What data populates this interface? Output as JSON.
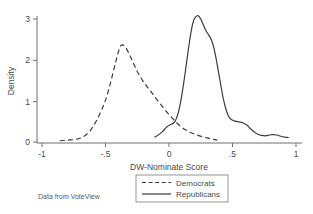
{
  "chart_data": {
    "type": "line",
    "title": "",
    "subtitle": "",
    "xlabel": "DW-Nominate Score",
    "ylabel": "Density",
    "xlim": [
      -1,
      1
    ],
    "ylim": [
      0,
      3.3
    ],
    "xticks": [
      -1,
      -0.5,
      0,
      0.5,
      1
    ],
    "xticklabels": [
      "-1",
      "-.5",
      "0",
      ".5",
      "1"
    ],
    "yticks": [
      0,
      1,
      2,
      3
    ],
    "yticklabels": [
      "0",
      "1",
      "2",
      "3"
    ],
    "grid": false,
    "legend_position": "below-axis-center",
    "annotation": "Data from VoteView",
    "series": [
      {
        "name": "Democrats",
        "style": "dashed",
        "color": "#3c3c3c",
        "peak_x": -0.37,
        "peak_y": 2.37,
        "x": [
          -0.86,
          -0.82,
          -0.78,
          -0.74,
          -0.7,
          -0.66,
          -0.62,
          -0.58,
          -0.54,
          -0.5,
          -0.46,
          -0.42,
          -0.39,
          -0.37,
          -0.34,
          -0.31,
          -0.28,
          -0.25,
          -0.22,
          -0.19,
          -0.16,
          -0.13,
          -0.1,
          -0.06,
          -0.02,
          0.02,
          0.06,
          0.1,
          0.14,
          0.18,
          0.22,
          0.26,
          0.3,
          0.34,
          0.38
        ],
        "y": [
          0.03,
          0.04,
          0.05,
          0.06,
          0.09,
          0.16,
          0.28,
          0.47,
          0.72,
          1.02,
          1.45,
          1.95,
          2.28,
          2.37,
          2.3,
          2.12,
          1.92,
          1.72,
          1.56,
          1.42,
          1.3,
          1.18,
          1.05,
          0.9,
          0.74,
          0.6,
          0.47,
          0.36,
          0.28,
          0.22,
          0.17,
          0.13,
          0.1,
          0.07,
          0.05
        ]
      },
      {
        "name": "Republicans",
        "style": "solid",
        "color": "#3c3c3c",
        "peak_x": 0.23,
        "peak_y": 3.08,
        "x": [
          -0.11,
          -0.08,
          -0.05,
          -0.02,
          0.01,
          0.03,
          0.05,
          0.07,
          0.09,
          0.11,
          0.13,
          0.15,
          0.17,
          0.19,
          0.21,
          0.23,
          0.25,
          0.27,
          0.29,
          0.31,
          0.33,
          0.35,
          0.37,
          0.39,
          0.41,
          0.43,
          0.45,
          0.47,
          0.49,
          0.52,
          0.55,
          0.58,
          0.61,
          0.64,
          0.67,
          0.7,
          0.73,
          0.76,
          0.79,
          0.82,
          0.85,
          0.88,
          0.91,
          0.94
        ],
        "y": [
          0.12,
          0.18,
          0.26,
          0.36,
          0.42,
          0.45,
          0.52,
          0.68,
          0.95,
          1.32,
          1.75,
          2.2,
          2.62,
          2.92,
          3.05,
          3.08,
          3.0,
          2.86,
          2.72,
          2.62,
          2.52,
          2.34,
          2.05,
          1.7,
          1.35,
          1.02,
          0.78,
          0.62,
          0.55,
          0.51,
          0.49,
          0.47,
          0.42,
          0.33,
          0.25,
          0.19,
          0.16,
          0.15,
          0.17,
          0.18,
          0.17,
          0.14,
          0.12,
          0.11
        ]
      }
    ],
    "legend_entries": [
      {
        "label": "Democrats",
        "style": "dashed"
      },
      {
        "label": "Republicans",
        "style": "solid"
      }
    ]
  }
}
